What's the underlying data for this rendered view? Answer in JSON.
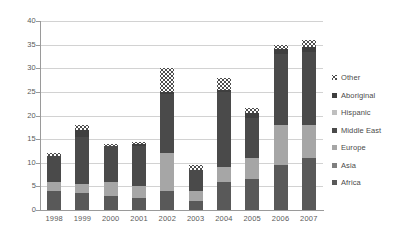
{
  "chart_data": {
    "type": "bar",
    "subtype": "stacked-column",
    "title": "",
    "xlabel": "",
    "ylabel": "",
    "ylim": [
      0,
      40
    ],
    "ytick_step": 5,
    "yticks": [
      0,
      5,
      10,
      15,
      20,
      25,
      30,
      35,
      40
    ],
    "grid": true,
    "legend_position": "right",
    "categories": [
      "1998",
      "1999",
      "2000",
      "2001",
      "2002",
      "2003",
      "2004",
      "2005",
      "2006",
      "2007"
    ],
    "stack_order_bottom_to_top": [
      "Africa",
      "Asia",
      "Europe",
      "Middle East",
      "Hispanic",
      "Aboriginal",
      "Other"
    ],
    "series": [
      {
        "name": "Africa",
        "color": "#595959",
        "values": [
          4.0,
          3.5,
          3.0,
          2.5,
          4.0,
          2.0,
          6.0,
          6.5,
          9.5,
          11.0
        ]
      },
      {
        "name": "Asia",
        "color": "#7f7f7f",
        "values": [
          0.0,
          0.0,
          0.0,
          0.0,
          0.0,
          0.0,
          0.0,
          0.0,
          0.0,
          0.0
        ]
      },
      {
        "name": "Europe",
        "color": "#a6a6a6",
        "values": [
          2.0,
          2.0,
          3.0,
          2.5,
          8.0,
          2.0,
          3.0,
          4.5,
          8.5,
          7.0
        ]
      },
      {
        "name": "Middle East",
        "color": "#4a4a4a",
        "values": [
          5.5,
          10.0,
          7.5,
          8.5,
          12.5,
          4.5,
          16.0,
          8.5,
          15.0,
          15.5
        ]
      },
      {
        "name": "Hispanic",
        "color": "#bfbfbf",
        "values": [
          0.0,
          0.0,
          0.0,
          0.0,
          0.0,
          0.0,
          0.0,
          0.0,
          0.0,
          0.0
        ]
      },
      {
        "name": "Aboriginal",
        "color": "#3f3f3f",
        "values": [
          0.0,
          1.5,
          0.0,
          0.5,
          0.5,
          0.0,
          0.5,
          1.0,
          1.0,
          1.0
        ]
      },
      {
        "name": "Other",
        "color": "pattern-dotted",
        "values": [
          0.5,
          1.0,
          0.5,
          0.5,
          5.0,
          1.0,
          2.5,
          1.0,
          1.0,
          1.5
        ]
      }
    ],
    "totals": [
      12.0,
      18.0,
      14.0,
      14.5,
      30.0,
      9.5,
      28.0,
      21.5,
      35.0,
      36.0
    ]
  },
  "legend": {
    "items": [
      {
        "label": "Other",
        "swatch": "pattern-dotted-swatch"
      },
      {
        "label": "Aboriginal",
        "swatch": "solid-swatch"
      },
      {
        "label": "Hispanic",
        "swatch": "solid-swatch"
      },
      {
        "label": "Middle East",
        "swatch": "solid-swatch"
      },
      {
        "label": "Europe",
        "swatch": "solid-swatch"
      },
      {
        "label": "Asia",
        "swatch": "solid-swatch"
      },
      {
        "label": "Africa",
        "swatch": "solid-swatch"
      }
    ]
  }
}
